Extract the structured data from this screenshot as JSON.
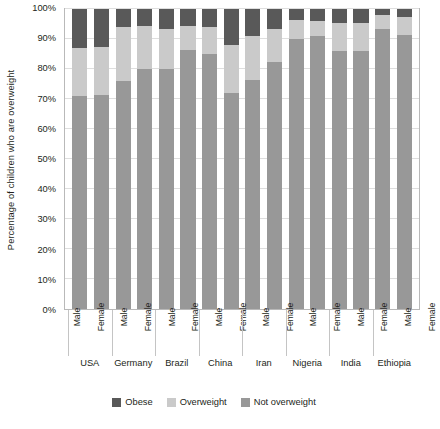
{
  "chart_data": {
    "type": "bar",
    "subtype": "stacked-100-percent",
    "title": "",
    "xlabel": "",
    "ylabel": "Percentage of children who are overweight",
    "ylim": [
      0,
      100
    ],
    "ytick_labels": [
      "100%",
      "90%",
      "80%",
      "70%",
      "60%",
      "50%",
      "40%",
      "30%",
      "20%",
      "10%",
      "0%"
    ],
    "ytick_values": [
      100,
      90,
      80,
      70,
      60,
      50,
      40,
      30,
      20,
      10,
      0
    ],
    "grid": true,
    "legend_position": "bottom",
    "groups": [
      "USA",
      "Germany",
      "Brazil",
      "China",
      "Iran",
      "Nigeria",
      "India",
      "Ethiopia"
    ],
    "subcategories": [
      "Male",
      "Female"
    ],
    "categories": [
      "USA Male",
      "USA Female",
      "Germany Male",
      "Germany Female",
      "Brazil Male",
      "Brazil Female",
      "China Male",
      "China Female",
      "Iran Male",
      "Iran Female",
      "Nigeria Male",
      "Nigeria Female",
      "India Male",
      "India Female",
      "Ethiopia Male",
      "Ethiopia Female"
    ],
    "series": [
      {
        "name": "Not overweight",
        "color": "#989898",
        "values": [
          71,
          71.5,
          76,
          80,
          80,
          86.5,
          85,
          72,
          76.5,
          82.5,
          90,
          91,
          86,
          86,
          93.5,
          91.5
        ]
      },
      {
        "name": "Overweight",
        "color": "#cacaca",
        "values": [
          16,
          16,
          18,
          14.5,
          13.5,
          8,
          9,
          16,
          14.5,
          11,
          6.5,
          5,
          9.5,
          9.5,
          4.5,
          6
        ]
      },
      {
        "name": "Obese",
        "color": "#595959",
        "values": [
          13,
          12.5,
          6,
          5.5,
          6.5,
          5.5,
          6,
          12,
          9,
          6.5,
          3.5,
          4,
          4.5,
          4.5,
          2,
          2.5
        ]
      }
    ]
  },
  "axis": {
    "y_title": "Percentage of children who are overweight"
  },
  "x_axis": {
    "bar_labels": [
      "Male",
      "Female",
      "Male",
      "Female",
      "Male",
      "Female",
      "Male",
      "Female",
      "Male",
      "Female",
      "Male",
      "Female",
      "Male",
      "Female",
      "Male",
      "Female"
    ],
    "group_labels": [
      "USA",
      "Germany",
      "Brazil",
      "China",
      "Iran",
      "Nigeria",
      "India",
      "Ethiopia"
    ]
  },
  "legend": {
    "items": [
      {
        "label": "Obese",
        "color": "#595959"
      },
      {
        "label": "Overweight",
        "color": "#cacaca"
      },
      {
        "label": "Not overweight",
        "color": "#989898"
      }
    ]
  },
  "colors": {
    "obese": "#595959",
    "overweight": "#cacaca",
    "not_overweight": "#989898",
    "gridline": "#dedede",
    "frame": "#b9b9b9",
    "text": "#231f20",
    "background": "#ffffff"
  }
}
